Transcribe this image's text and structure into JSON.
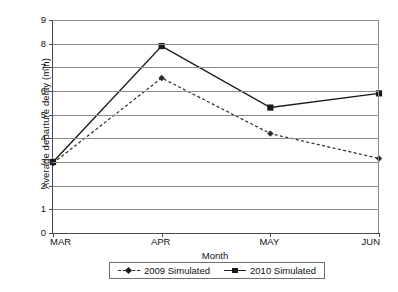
{
  "chart_data": {
    "type": "line",
    "title": "",
    "xlabel": "Month",
    "ylabel": "Average departure delay (min)",
    "categories": [
      "MAR",
      "APR",
      "MAY",
      "JUN"
    ],
    "ylim": [
      0,
      9
    ],
    "yticks": [
      0,
      1,
      2,
      3,
      4,
      5,
      6,
      7,
      8,
      9
    ],
    "ytick_labels": [
      "0",
      "1",
      "2",
      "3",
      "4",
      "5",
      "6",
      "7",
      "8",
      "9"
    ],
    "grid": true,
    "legend_position": "bottom",
    "series": [
      {
        "name": "2009 Simulated",
        "values": [
          2.95,
          6.55,
          4.2,
          3.15
        ],
        "line_style": "dashed",
        "marker": "diamond",
        "color": "#2a2a2a"
      },
      {
        "name": "2010 Simulated",
        "values": [
          3.0,
          7.9,
          5.3,
          5.9
        ],
        "line_style": "solid",
        "marker": "square",
        "color": "#1a1a1a"
      }
    ]
  },
  "axes": {
    "y_title": "Average departure delay (min)",
    "x_title": "Month"
  },
  "legend": {
    "entries": [
      {
        "label": "2009 Simulated"
      },
      {
        "label": "2010 Simulated"
      }
    ]
  },
  "colors": {
    "axis": "#4a4a4a",
    "grid": "#8c8c8c",
    "series_2009": "#2a2a2a",
    "series_2010": "#1a1a1a",
    "background": "#ffffff"
  }
}
